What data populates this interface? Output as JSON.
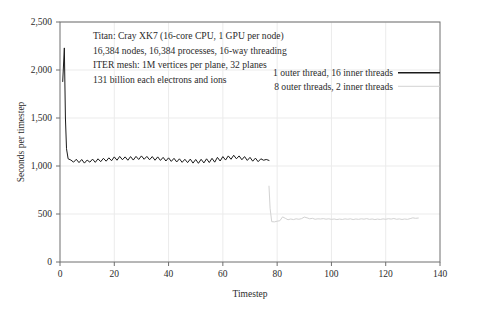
{
  "chart_data": {
    "type": "line",
    "title": "",
    "xlabel": "Timestep",
    "ylabel": "Seconds per timestep",
    "xlim": [
      0,
      140
    ],
    "ylim": [
      0,
      2500
    ],
    "xticks": [
      "0",
      "20",
      "40",
      "60",
      "80",
      "100",
      "120",
      "140"
    ],
    "xtick_values": [
      0,
      20,
      40,
      60,
      80,
      100,
      120,
      140
    ],
    "yticks": [
      "0",
      "500",
      "1,000",
      "1,500",
      "2,000",
      "2,500"
    ],
    "ytick_values": [
      0,
      500,
      1000,
      1500,
      2000,
      2500
    ],
    "grid": true,
    "legend_position": "upper-right-inside",
    "annotations": [
      "Titan: Cray XK7 (16-core CPU, 1 GPU per node)",
      "16,384 nodes, 16,384 processes, 16-way threading",
      "ITER mesh: 1M vertices per plane, 32 planes",
      "131 billion each electrons and ions"
    ],
    "series": [
      {
        "name": "1 outer thread, 16 inner threads",
        "color": "#1a1a1a",
        "x": [
          1,
          1.6,
          2,
          2.4,
          3,
          4,
          5,
          6,
          7,
          8,
          9,
          10,
          11,
          12,
          13,
          14,
          15,
          16,
          17,
          18,
          19,
          20,
          21,
          22,
          23,
          24,
          25,
          26,
          27,
          28,
          29,
          30,
          31,
          32,
          33,
          34,
          35,
          36,
          37,
          38,
          39,
          40,
          41,
          42,
          43,
          44,
          45,
          46,
          47,
          48,
          49,
          50,
          51,
          52,
          53,
          54,
          55,
          56,
          57,
          58,
          59,
          60,
          61,
          62,
          63,
          64,
          65,
          66,
          67,
          68,
          69,
          70,
          71,
          72,
          73,
          74,
          75,
          76,
          77
        ],
        "values": [
          1880,
          2230,
          1500,
          1180,
          1075,
          1062,
          1040,
          1070,
          1035,
          1068,
          1030,
          1062,
          1040,
          1072,
          1038,
          1075,
          1045,
          1080,
          1050,
          1085,
          1055,
          1095,
          1060,
          1100,
          1065,
          1095,
          1060,
          1098,
          1062,
          1100,
          1068,
          1105,
          1070,
          1100,
          1065,
          1098,
          1060,
          1095,
          1058,
          1090,
          1052,
          1085,
          1048,
          1080,
          1042,
          1075,
          1038,
          1070,
          1035,
          1072,
          1030,
          1068,
          1028,
          1070,
          1032,
          1075,
          1036,
          1080,
          1040,
          1090,
          1052,
          1098,
          1062,
          1105,
          1070,
          1112,
          1075,
          1105,
          1065,
          1098,
          1058,
          1090,
          1050,
          1082,
          1045,
          1075,
          1060,
          1068,
          1058
        ]
      },
      {
        "name": "8 outer threads, 2 inner threads",
        "color": "#d2d2d2",
        "x": [
          77,
          77.4,
          78,
          79,
          80,
          81,
          82,
          83,
          84,
          85,
          86,
          87,
          88,
          89,
          90,
          91,
          92,
          93,
          94,
          95,
          96,
          97,
          98,
          99,
          100,
          101,
          102,
          103,
          104,
          105,
          106,
          107,
          108,
          109,
          110,
          111,
          112,
          113,
          114,
          115,
          116,
          117,
          118,
          119,
          120,
          121,
          122,
          123,
          124,
          125,
          126,
          127,
          128,
          129,
          130,
          131,
          132
        ],
        "values": [
          790,
          560,
          420,
          418,
          425,
          430,
          470,
          455,
          440,
          448,
          442,
          450,
          445,
          452,
          468,
          460,
          450,
          455,
          445,
          450,
          448,
          452,
          446,
          450,
          444,
          448,
          442,
          447,
          443,
          449,
          445,
          450,
          442,
          448,
          444,
          450,
          446,
          452,
          444,
          448,
          442,
          447,
          443,
          449,
          445,
          451,
          447,
          453,
          445,
          449,
          443,
          448,
          444,
          452,
          460,
          455,
          458
        ]
      }
    ]
  },
  "legend": {
    "items": [
      {
        "label": "1 outer thread, 16 inner threads",
        "color": "#1a1a1a"
      },
      {
        "label": "8 outer threads, 2 inner threads",
        "color": "#d2d2d2"
      }
    ]
  },
  "axes": {
    "x_title": "Timestep",
    "y_title": "Seconds per timestep"
  }
}
